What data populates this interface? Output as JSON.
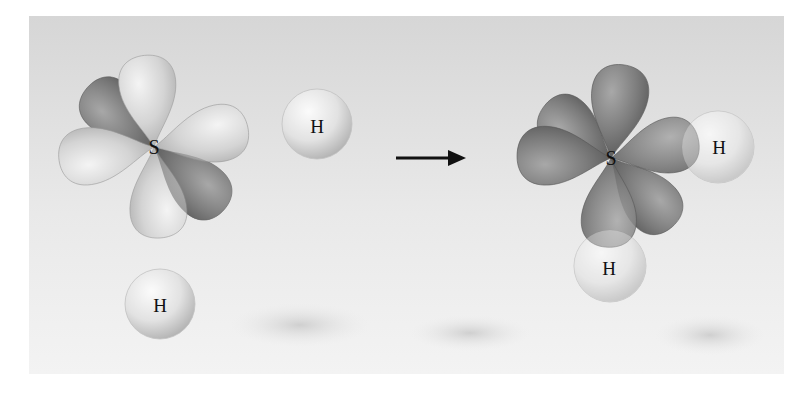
{
  "diagram": {
    "reactants": {
      "central_atom": {
        "label": "S",
        "orbitals": "p-orbitals (4 lobes light, 2 lobes dark/half-filled)"
      },
      "hydrogen_atoms": [
        {
          "label": "H",
          "position": "upper-middle"
        },
        {
          "label": "H",
          "position": "lower-left"
        }
      ]
    },
    "arrow": {
      "direction": "right",
      "meaning": "yields"
    },
    "product": {
      "central_atom": {
        "label": "S"
      },
      "hydrogen_atoms": [
        {
          "label": "H",
          "position": "right"
        },
        {
          "label": "H",
          "position": "bottom"
        }
      ]
    },
    "colors": {
      "background_top": "#d6d6d6",
      "background_bottom": "#f2f2f2",
      "light_lobe": "#d9d9d9",
      "dark_lobe": "#7a7a7a",
      "hydrogen_sphere": "#e8e8e8",
      "arrow": "#111111",
      "text": "#111111"
    }
  }
}
